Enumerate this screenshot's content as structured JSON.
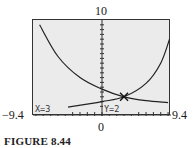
{
  "chart_data": {
    "type": "line",
    "title": "",
    "caption": "FIGURE 8.44",
    "window": {
      "xmin": -9.4,
      "xmax": 9.4,
      "ymin": 0,
      "ymax": 10
    },
    "tick_labels": {
      "ymax": "10",
      "ymin": "0",
      "xmin": "-9.4",
      "xmax": "9.4"
    },
    "series": [
      {
        "name": "decreasing curve",
        "description": "decays from top-left toward the right",
        "points": [
          [
            -8.5,
            9.5
          ],
          [
            -6,
            6.2
          ],
          [
            -3,
            4.0
          ],
          [
            0,
            2.8
          ],
          [
            3,
            2.0
          ],
          [
            6,
            1.6
          ],
          [
            9,
            1.4
          ]
        ]
      },
      {
        "name": "increasing curve",
        "description": "rises slowly then steeply at the right",
        "points": [
          [
            -8.5,
            0.5
          ],
          [
            -4,
            1.0
          ],
          [
            0,
            1.5
          ],
          [
            3,
            2.0
          ],
          [
            6,
            3.4
          ],
          [
            8,
            5.5
          ],
          [
            9.2,
            8.0
          ]
        ]
      }
    ],
    "intersection": {
      "x": 3,
      "y": 2,
      "marker": "x-cross"
    },
    "trace_readout": {
      "x_text": "X=3",
      "y_text": "Y=2"
    },
    "grid": false,
    "axes_ticks": true
  },
  "labels": {
    "ymax": "10",
    "xmin": "−9.4",
    "xmax": "9.4",
    "origin": "0",
    "caption": "FIGURE 8.44",
    "x_readout": "X=3",
    "y_readout": "Y=2"
  }
}
